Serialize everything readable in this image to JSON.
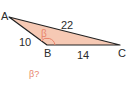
{
  "diagram": {
    "vertices": {
      "A": {
        "label": "A",
        "x": 9,
        "y": 17
      },
      "B": {
        "label": "B",
        "x": 47,
        "y": 45
      },
      "C": {
        "label": "C",
        "x": 120,
        "y": 45
      }
    },
    "sides": {
      "AB": "10",
      "AC": "22",
      "BC": "14"
    },
    "angle_label": "β",
    "question": "β?",
    "colors": {
      "fill": "#f6c9b4",
      "stroke": "#222222",
      "accent": "#e8846b"
    }
  }
}
